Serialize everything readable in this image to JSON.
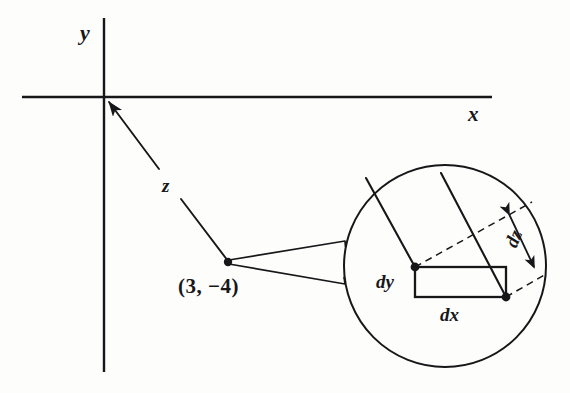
{
  "figure": {
    "ink_color": "#17171a",
    "background_color": "#fdfdfc"
  },
  "axes": {
    "x_label": "x",
    "y_label": "y",
    "origin": {
      "x": 104,
      "y": 97
    },
    "x_axis": {
      "x1": 22,
      "y1": 97,
      "x2": 492,
      "y2": 97
    },
    "y_axis": {
      "x1": 104,
      "y1": 18,
      "x2": 104,
      "y2": 372
    }
  },
  "vector": {
    "label": "z",
    "point_label": "(3, −4)",
    "tail": {
      "x": 228,
      "y": 262
    },
    "head": {
      "x": 106,
      "y": 100
    },
    "label_gap_start": {
      "x": 180,
      "y": 198
    },
    "label_gap_end": {
      "x": 158,
      "y": 168
    }
  },
  "magnifier": {
    "circle": {
      "cx": 445,
      "cy": 266,
      "r": 101
    },
    "funnel_apex": {
      "x": 228,
      "y": 262
    },
    "funnel_top": {
      "x": 345,
      "y": 241
    },
    "funnel_bottom": {
      "x": 345,
      "y": 284
    },
    "labels": {
      "dx": "dx",
      "dy": "dy",
      "dz": "dz"
    },
    "rectangle": {
      "left": 415,
      "top": 267,
      "right": 505,
      "bottom": 297
    },
    "ray_upper_from": {
      "x": 415,
      "y": 267
    },
    "ray_upper_to": {
      "x": 365,
      "y": 178
    },
    "ray_lower_from": {
      "x": 505,
      "y": 297
    },
    "ray_lower_to": {
      "x": 440,
      "y": 173
    },
    "dashed_upper_from": {
      "x": 415,
      "y": 267
    },
    "dashed_upper_to": {
      "x": 531,
      "y": 203
    },
    "dashed_lower_from": {
      "x": 505,
      "y": 297
    },
    "dashed_lower_to": {
      "x": 545,
      "y": 275
    }
  }
}
